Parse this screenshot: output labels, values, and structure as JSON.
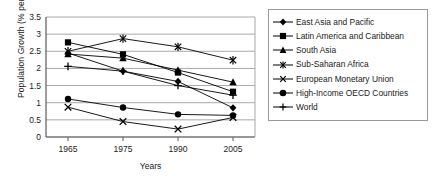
{
  "chart_data": {
    "type": "line",
    "title": "",
    "xlabel": "Years",
    "ylabel": "Population Growth (% per annum)",
    "categories": [
      "1965",
      "1975",
      "1990",
      "2005"
    ],
    "x": [
      1965,
      1975,
      1990,
      2005
    ],
    "ylim": [
      0,
      3.5
    ],
    "yticks": [
      "0",
      "0.5",
      "1",
      "1.5",
      "2",
      "2.5",
      "3",
      "3.5"
    ],
    "ytick_values": [
      0,
      0.5,
      1,
      1.5,
      2,
      2.5,
      3,
      3.5
    ],
    "grid": "horizontal",
    "legend_position": "right",
    "series": [
      {
        "name": "East Asia and Pacific",
        "marker": "diamond",
        "values": [
          2.45,
          1.92,
          1.62,
          0.85
        ]
      },
      {
        "name": "Latin America and Caribbean",
        "marker": "square",
        "values": [
          2.76,
          2.41,
          1.88,
          1.32
        ]
      },
      {
        "name": "South Asia",
        "marker": "triangle",
        "values": [
          2.42,
          2.3,
          1.95,
          1.6
        ]
      },
      {
        "name": "Sub-Saharan Africa",
        "marker": "asterisk",
        "values": [
          2.5,
          2.87,
          2.63,
          2.24
        ]
      },
      {
        "name": "European Monetary Union",
        "marker": "cross",
        "values": [
          0.87,
          0.45,
          0.23,
          0.57
        ]
      },
      {
        "name": "High-Income OECD Countries",
        "marker": "circle",
        "values": [
          1.11,
          0.86,
          0.66,
          0.63
        ]
      },
      {
        "name": "World",
        "marker": "plus",
        "values": [
          2.06,
          1.92,
          1.5,
          1.22
        ]
      }
    ]
  },
  "axis": {
    "y_title": "Population Growth (% per annum)",
    "x_title": "Years"
  },
  "legend": {
    "items": [
      {
        "label": "East Asia and Pacific",
        "marker": "diamond"
      },
      {
        "label": "Latin America and Caribbean",
        "marker": "square"
      },
      {
        "label": "South Asia",
        "marker": "triangle"
      },
      {
        "label": "Sub-Saharan Africa",
        "marker": "asterisk"
      },
      {
        "label": "European Monetary Union",
        "marker": "cross"
      },
      {
        "label": "High-Income OECD Countries",
        "marker": "circle"
      },
      {
        "label": "World",
        "marker": "plus"
      }
    ]
  },
  "colors": {
    "series": "#000000",
    "grid": "#a9a9a9",
    "axis": "#5a5a5a",
    "text": "#1a1a1a",
    "background": "#ffffff"
  }
}
